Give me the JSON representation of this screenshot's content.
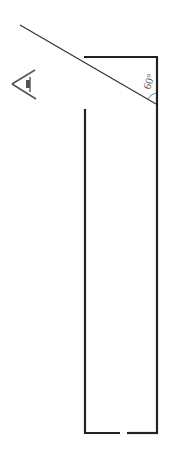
{
  "diagram": {
    "angle_label": "60°",
    "colors": {
      "stroke": "#222222",
      "mirror": "#333333",
      "eye": "#555555",
      "label": "#555555",
      "background": "#ffffff"
    },
    "elements": {
      "mirror_line": {
        "x1": 20,
        "y1": 25,
        "x2": 156,
        "y2": 104
      },
      "tube_top": {
        "x1": 84,
        "y1": 57,
        "x2": 158,
        "y2": 57
      },
      "tube_right": {
        "x1": 157,
        "y1": 57,
        "x2": 157,
        "y2": 434
      },
      "tube_left": {
        "x1": 85,
        "y1": 109,
        "x2": 85,
        "y2": 434
      },
      "tube_bottom_left": {
        "x1": 85,
        "y1": 433,
        "x2": 120,
        "y2": 433
      },
      "tube_bottom_right": {
        "x1": 127,
        "y1": 433,
        "x2": 158,
        "y2": 433
      },
      "eye": {
        "x": 10,
        "y": 70,
        "direction": "right"
      }
    }
  }
}
